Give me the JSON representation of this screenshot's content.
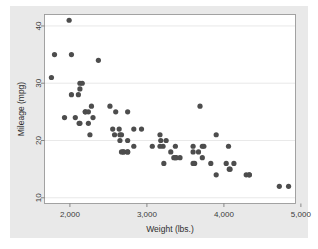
{
  "figure": {
    "canvas_color": "#e9e9e9",
    "plot_background": "#ffffff",
    "marker_color": "#4d4d4d",
    "grid_color": "#e3e3e3",
    "frame_color": "#9a9a9a"
  },
  "chart_data": {
    "type": "scatter",
    "title": "",
    "xlabel": "Weight (lbs.)",
    "ylabel": "Mileage (mpg)",
    "xlim": [
      1670,
      4930
    ],
    "ylim": [
      9,
      42
    ],
    "xticks": [
      2000,
      3000,
      4000,
      5000
    ],
    "xticklabels": [
      "2,000",
      "3,000",
      "4,000",
      "5,000"
    ],
    "yticks": [
      10,
      20,
      30,
      40
    ],
    "yticklabels": [
      "10",
      "20",
      "30",
      "40"
    ],
    "grid": "horizontal",
    "legend": "none",
    "marker": "filled-circle",
    "marker_size": 2.6,
    "n_points": 74,
    "series": [
      {
        "name": "mpg vs weight",
        "x": [
          2930,
          3350,
          2640,
          3250,
          4080,
          3670,
          3690,
          3180,
          3220,
          4060,
          3600,
          3600,
          3740,
          4840,
          3900,
          4290,
          4330,
          3900,
          4330,
          3720,
          3370,
          2110,
          2200,
          2670,
          2595,
          2700,
          2556,
          2200,
          3310,
          2750,
          2280,
          3430,
          3380,
          4070,
          3620,
          3070,
          2120,
          2650,
          3600,
          2750,
          4720,
          3830,
          2580,
          4130,
          3720,
          3370,
          4030,
          3210,
          2020,
          2830,
          2070,
          2130,
          1800,
          2650,
          2750,
          1760,
          2020,
          2130,
          2160,
          1930,
          1990,
          3170,
          2690,
          2240,
          2520,
          2300,
          2240,
          2260,
          2750,
          2670,
          2370,
          2130,
          2830,
          3170
        ],
        "y": [
          22,
          17,
          22,
          20,
          15,
          18,
          26,
          20,
          16,
          19,
          19,
          18,
          19,
          12,
          14,
          14,
          14,
          21,
          14,
          19,
          17,
          28,
          25,
          21,
          25,
          18,
          22,
          25,
          18,
          20,
          26,
          17,
          17,
          15,
          16,
          19,
          23,
          20,
          16,
          18,
          12,
          16,
          21,
          16,
          17,
          19,
          16,
          19,
          35,
          19,
          24,
          23,
          35,
          21,
          18,
          31,
          28,
          30,
          30,
          24,
          41,
          21,
          18,
          25,
          26,
          24,
          23,
          21,
          25,
          18,
          34,
          29,
          22,
          19
        ]
      }
    ]
  },
  "axes": {
    "y_axis_title": "Mileage (mpg)",
    "x_axis_title": "Weight (lbs.)"
  }
}
